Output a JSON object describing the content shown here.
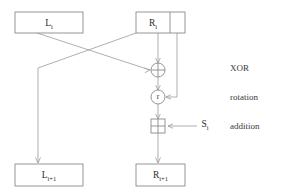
{
  "diagram": {
    "colors": {
      "stroke": "#8a8a8a",
      "edge": "#9a9a9a",
      "text": "#2b2b2b",
      "background": "#ffffff"
    },
    "nodes": {
      "left_in": {
        "label": "L",
        "subscript": "i"
      },
      "right_in": {
        "label": "R",
        "subscript": "i"
      },
      "left_out": {
        "label": "L",
        "subscript": "i+1"
      },
      "right_out": {
        "label": "R",
        "subscript": "i+1"
      },
      "subkey": {
        "label": "S",
        "subscript": "i"
      },
      "rotation_node": {
        "label": "r"
      },
      "xor_node": {
        "label": "+"
      },
      "addition_node": {
        "label": "+"
      }
    },
    "annotations": [
      {
        "label": "XOR"
      },
      {
        "label": "rotation"
      },
      {
        "label": "addition"
      }
    ]
  }
}
